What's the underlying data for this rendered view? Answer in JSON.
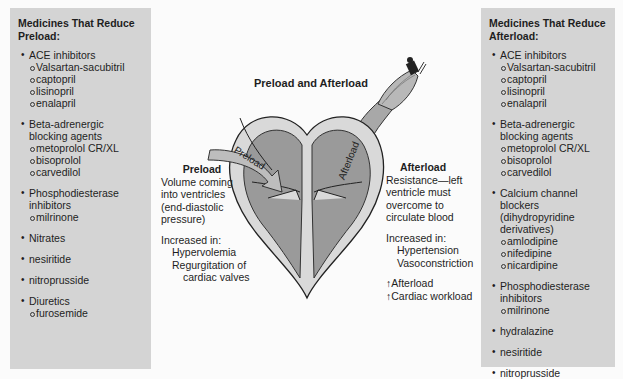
{
  "left_panel": {
    "title": "Medicines That Reduce Preload:",
    "items": [
      {
        "label": "ACE inhibitors",
        "sub": [
          "Valsartan-sacubitril",
          "captopril",
          "lisinopril",
          "enalapril"
        ]
      },
      {
        "label": "Beta-adrenergic blocking agents",
        "sub": [
          "metoprolol CR/XL",
          "bisoprolol",
          "carvedilol"
        ]
      },
      {
        "label": "Phosphodiesterase inhibitors",
        "sub": [
          "milrinone"
        ]
      },
      {
        "label": "Nitrates",
        "sub": []
      },
      {
        "label": "nesiritide",
        "sub": []
      },
      {
        "label": "nitroprusside",
        "sub": []
      },
      {
        "label": "Diuretics",
        "sub": [
          "furosemide"
        ]
      }
    ]
  },
  "right_panel": {
    "title": "Medicines That Reduce Afterload:",
    "items": [
      {
        "label": "ACE inhibitors",
        "sub": [
          "Valsartan-sacubitril",
          "captopril",
          "lisinopril",
          "enalapril"
        ]
      },
      {
        "label": "Beta-adrenergic blocking agents",
        "sub": [
          "metoprolol CR/XL",
          "bisoprolol",
          "carvedilol"
        ]
      },
      {
        "label": "Calcium channel blockers (dihydropyridine derivatives)",
        "sub": [
          "amlodipine",
          "nifedipine",
          "nicardipine"
        ]
      },
      {
        "label": "Phosphodiesterase inhibitors",
        "sub": [
          "milrinone"
        ]
      },
      {
        "label": "hydralazine",
        "sub": []
      },
      {
        "label": "nesiritide",
        "sub": []
      },
      {
        "label": "nitroprusside",
        "sub": []
      }
    ]
  },
  "diagram": {
    "title": "Preload and Afterload",
    "preload_arrow_label": "Preload",
    "afterload_arrow_label": "Afterload",
    "preload": {
      "heading": "Preload",
      "description": [
        "Volume coming",
        "into ventricles",
        "(end-diastolic",
        "pressure)"
      ],
      "increased_in_label": "Increased in:",
      "increased_in": [
        "Hypervolemia",
        "Regurgitation of",
        "cardiac valves"
      ]
    },
    "afterload": {
      "heading": "Afterload",
      "description": [
        "Resistance—left",
        "ventricle must",
        "overcome to",
        "circulate blood"
      ],
      "increased_in_label": "Increased in:",
      "increased_in": [
        "Hypertension",
        "Vasoconstriction"
      ],
      "effects": [
        "↑Afterload",
        "↑Cardiac workload"
      ]
    }
  },
  "colors": {
    "panel_bg": "#d4d4d4",
    "heart_outer": "#d9d9d9",
    "heart_inner": "#9a9a9a",
    "arrow_preload": "#bdbdbd",
    "aorta": "#a8a8a8"
  }
}
